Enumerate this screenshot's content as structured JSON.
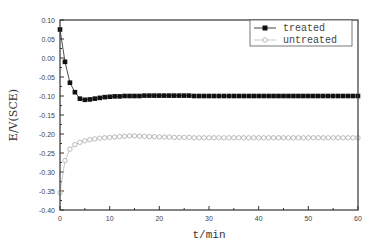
{
  "chart_data": {
    "type": "line",
    "title": "",
    "xlabel": "t/min",
    "ylabel": "E/V(SCE)",
    "xlim": [
      0,
      60
    ],
    "ylim": [
      -0.4,
      0.1
    ],
    "xticks": [
      0,
      10,
      20,
      30,
      40,
      50,
      60
    ],
    "xtick_labels": [
      "0",
      "10",
      "20",
      "30",
      "40",
      "50",
      "60"
    ],
    "yticks": [
      0.1,
      0.05,
      0.0,
      -0.05,
      -0.1,
      -0.15,
      -0.2,
      -0.25,
      -0.3,
      -0.35,
      -0.4
    ],
    "ytick_labels": [
      "0.10",
      "0.05",
      "0.00",
      "-0.05",
      "-0.10",
      "-0.15",
      "-0.20",
      "-0.25",
      "-0.30",
      "-0.35",
      "-0.40"
    ],
    "grid": false,
    "legend_position": "upper right",
    "series": [
      {
        "name": "treated",
        "marker": "filled-square",
        "color": "#111111",
        "x": [
          0,
          1,
          2,
          3,
          4,
          5,
          6,
          7,
          8,
          9,
          10,
          11,
          12,
          13,
          14,
          15,
          16,
          17,
          18,
          19,
          20,
          21,
          22,
          23,
          24,
          25,
          26,
          27,
          28,
          29,
          30,
          31,
          32,
          33,
          34,
          35,
          36,
          37,
          38,
          39,
          40,
          41,
          42,
          43,
          44,
          45,
          46,
          47,
          48,
          49,
          50,
          51,
          52,
          53,
          54,
          55,
          56,
          57,
          58,
          59,
          60
        ],
        "values": [
          0.075,
          -0.01,
          -0.065,
          -0.09,
          -0.107,
          -0.11,
          -0.109,
          -0.107,
          -0.105,
          -0.103,
          -0.102,
          -0.101,
          -0.101,
          -0.1,
          -0.1,
          -0.1,
          -0.1,
          -0.099,
          -0.099,
          -0.099,
          -0.099,
          -0.099,
          -0.099,
          -0.099,
          -0.099,
          -0.099,
          -0.099,
          -0.1,
          -0.1,
          -0.1,
          -0.1,
          -0.1,
          -0.1,
          -0.1,
          -0.1,
          -0.1,
          -0.1,
          -0.1,
          -0.1,
          -0.1,
          -0.1,
          -0.1,
          -0.1,
          -0.1,
          -0.1,
          -0.1,
          -0.1,
          -0.1,
          -0.1,
          -0.1,
          -0.1,
          -0.1,
          -0.1,
          -0.1,
          -0.1,
          -0.1,
          -0.1,
          -0.1,
          -0.1,
          -0.1,
          -0.1
        ]
      },
      {
        "name": "untreated",
        "marker": "open-circle",
        "color": "#aaaaaa",
        "x": [
          0,
          1,
          2,
          3,
          4,
          5,
          6,
          7,
          8,
          9,
          10,
          11,
          12,
          13,
          14,
          15,
          16,
          17,
          18,
          19,
          20,
          21,
          22,
          23,
          24,
          25,
          26,
          27,
          28,
          29,
          30,
          31,
          32,
          33,
          34,
          35,
          36,
          37,
          38,
          39,
          40,
          41,
          42,
          43,
          44,
          45,
          46,
          47,
          48,
          49,
          50,
          51,
          52,
          53,
          54,
          55,
          56,
          57,
          58,
          59,
          60
        ],
        "values": [
          -0.355,
          -0.27,
          -0.24,
          -0.228,
          -0.222,
          -0.218,
          -0.215,
          -0.213,
          -0.211,
          -0.21,
          -0.209,
          -0.208,
          -0.207,
          -0.206,
          -0.205,
          -0.205,
          -0.206,
          -0.206,
          -0.207,
          -0.207,
          -0.208,
          -0.208,
          -0.208,
          -0.209,
          -0.209,
          -0.209,
          -0.209,
          -0.21,
          -0.21,
          -0.21,
          -0.21,
          -0.21,
          -0.21,
          -0.21,
          -0.21,
          -0.21,
          -0.21,
          -0.21,
          -0.21,
          -0.21,
          -0.21,
          -0.21,
          -0.21,
          -0.21,
          -0.21,
          -0.21,
          -0.21,
          -0.21,
          -0.21,
          -0.21,
          -0.21,
          -0.21,
          -0.21,
          -0.21,
          -0.21,
          -0.21,
          -0.21,
          -0.21,
          -0.21,
          -0.21,
          -0.21
        ]
      }
    ]
  },
  "legend": {
    "items": [
      {
        "label": "treated",
        "marker": "filled-square",
        "color": "#111111"
      },
      {
        "label": "untreated",
        "marker": "open-circle",
        "color": "#aaaaaa"
      }
    ]
  },
  "axes": {
    "xlabel": "t/min",
    "ylabel": "E/V(SCE)"
  }
}
